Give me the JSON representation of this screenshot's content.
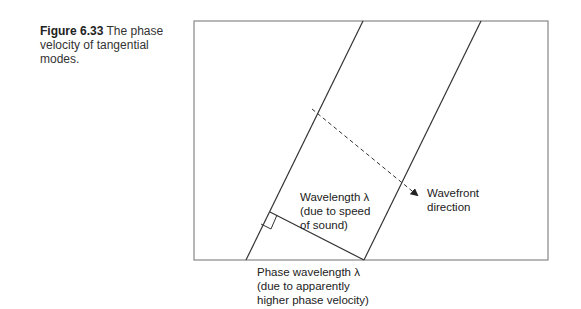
{
  "caption": {
    "number": "Figure 6.33",
    "text": "The phase velocity of tangential modes."
  },
  "diagram": {
    "labels": {
      "wavelength": [
        "Wavelength λ",
        "(due to speed",
        "of sound)"
      ],
      "wavefront": [
        "Wavefront",
        "direction"
      ],
      "phase_wavelength": [
        "Phase wavelength λ",
        "(due to apparently",
        "higher phase velocity)"
      ]
    },
    "colors": {
      "line": "#333333",
      "frame": "#888888"
    }
  }
}
